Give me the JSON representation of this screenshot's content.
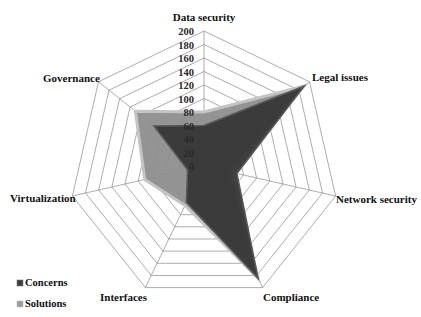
{
  "chart_data": {
    "type": "radar",
    "title": "",
    "categories": [
      "Data security",
      "Legal issues",
      "Network security",
      "Compliance",
      "Interfaces",
      "Virtualization",
      "Governance"
    ],
    "radial_ticks": [
      "0",
      "20",
      "40",
      "60",
      "80",
      "100",
      "120",
      "140",
      "160",
      "180",
      "200"
    ],
    "rmin": 0,
    "rmax": 200,
    "grid": true,
    "legend_position": "bottom-left",
    "series": [
      {
        "name": "Concerns",
        "color": "#363636",
        "edge_color": "#5a5a5a",
        "values": [
          60,
          190,
          50,
          185,
          60,
          25,
          95
        ]
      },
      {
        "name": "Solutions",
        "color": "#8e8e8e",
        "edge_color": "#c4c4c4",
        "values": [
          80,
          190,
          40,
          185,
          65,
          90,
          130
        ]
      }
    ]
  }
}
